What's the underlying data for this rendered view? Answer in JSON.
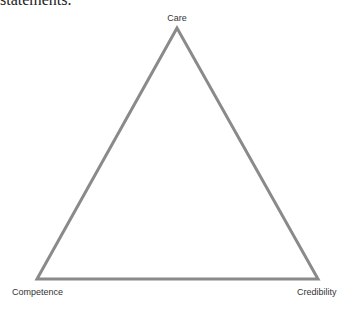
{
  "caption_fragment": "statements.",
  "diagram": {
    "shape": "triangle",
    "stroke_color": "#8a8a8a",
    "vertices": {
      "top": "Care",
      "bottom_left": "Competence",
      "bottom_right": "Credibility"
    }
  }
}
